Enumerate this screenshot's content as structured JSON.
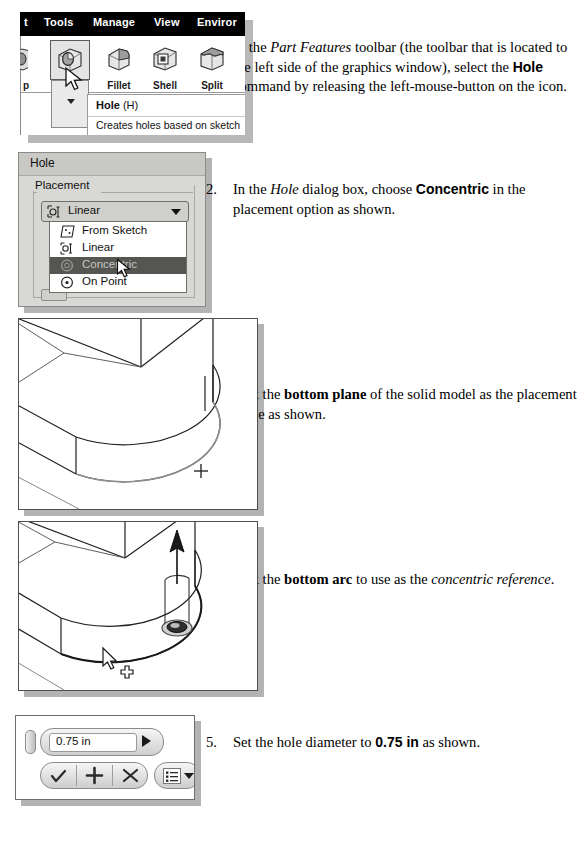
{
  "figure_toolbar": {
    "menus": [
      "t",
      "Tools",
      "Manage",
      "View",
      "Enviror"
    ],
    "partial_left_label": "p",
    "buttons": [
      {
        "label": "Hole",
        "icon": "hole-cube-icon",
        "selected": true
      },
      {
        "label": "Fillet",
        "icon": "fillet-cube-icon",
        "selected": false
      },
      {
        "label": "Shell",
        "icon": "shell-cube-icon",
        "selected": false
      },
      {
        "label": "Split",
        "icon": "split-cube-icon",
        "selected": false
      }
    ],
    "tooltip": {
      "title": "Hole",
      "shortcut": "(H)",
      "description": "Creates holes based on sketch"
    }
  },
  "figure_dialog": {
    "title": "Hole",
    "group_legend": "Placement",
    "combo_value": "Linear",
    "combo_icon": "linear-placement-icon",
    "options": [
      {
        "label": "From Sketch",
        "icon": "from-sketch-icon",
        "selected": false
      },
      {
        "label": "Linear",
        "icon": "linear-placement-icon",
        "selected": false
      },
      {
        "label": "Concentric",
        "icon": "concentric-icon",
        "selected": true
      },
      {
        "label": "On Point",
        "icon": "on-point-icon",
        "selected": false
      }
    ]
  },
  "figure_dimension_toolbar": {
    "value": "0.75 in",
    "accept_label": "✓",
    "add_label": "+",
    "cancel_label": "✕",
    "menu_icon": "list-menu-icon",
    "next_icon": "play-arrow-icon",
    "grip_icon": "drag-grip-icon"
  },
  "steps": [
    {
      "number": "1.",
      "html": "In the <i>Part Features</i> toolbar (the toolbar that is located to the left side of the graphics window), select the <b>Hole</b> command by releasing the left-mouse-button on the icon."
    },
    {
      "number": "2.",
      "html": "In the <i>Hole</i> dialog box, choose <b>Concentric</b> in the placement option as shown."
    },
    {
      "number": "3.",
      "html": "Pick the <b class=\"serifb\">bottom plane</b> of the solid model as the placement plane as shown."
    },
    {
      "number": "4.",
      "html": "Pick the <b class=\"serifb\">bottom arc</b> to use as the <i>concentric reference</i>."
    },
    {
      "number": "5.",
      "html": "Set the hole diameter to <b>0.75 in</b> as shown."
    }
  ],
  "colors": {
    "menubar_bg": "#000000",
    "dialog_bg": "#d8d8d4",
    "highlight_bg": "#555551",
    "shadow": "#b3b3b3",
    "line": "#4f4f4f"
  }
}
